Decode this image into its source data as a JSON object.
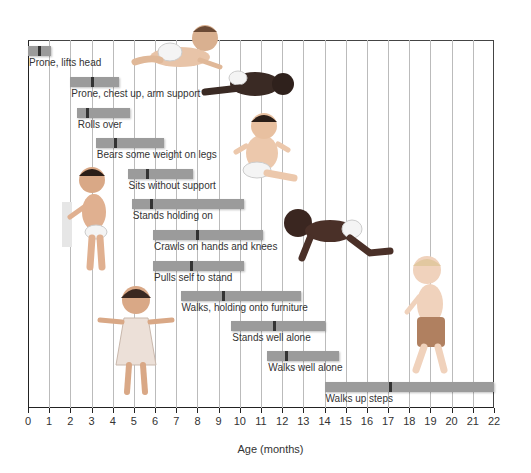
{
  "chart_data": {
    "type": "bar",
    "subtype": "range-bar (Gantt) with median markers",
    "title": "",
    "xlabel": "Age (months)",
    "ylabel": "",
    "xlim": [
      0,
      22
    ],
    "xticks": [
      0,
      1,
      2,
      3,
      4,
      5,
      6,
      7,
      8,
      9,
      10,
      11,
      12,
      13,
      14,
      15,
      16,
      17,
      18,
      19,
      20,
      21,
      22
    ],
    "grid": "vertical lines at each month",
    "legend": null,
    "bar_color": "#9b9b9b",
    "marker_color": "#333333",
    "milestones": [
      {
        "label": "Prone, lifts head",
        "start": 0.0,
        "end": 1.1,
        "marker": 0.5
      },
      {
        "label": "Prone, chest up, arm support",
        "start": 2.0,
        "end": 4.3,
        "marker": 3.0
      },
      {
        "label": "Rolls over",
        "start": 2.3,
        "end": 4.8,
        "marker": 2.8
      },
      {
        "label": "Bears some weight on legs",
        "start": 3.2,
        "end": 6.4,
        "marker": 4.1
      },
      {
        "label": "Sits without support",
        "start": 4.7,
        "end": 7.8,
        "marker": 5.6
      },
      {
        "label": "Stands holding on",
        "start": 4.9,
        "end": 10.2,
        "marker": 5.8
      },
      {
        "label": "Crawls on hands and knees",
        "start": 5.9,
        "end": 11.1,
        "marker": 8.0
      },
      {
        "label": "Pulls self to stand",
        "start": 5.9,
        "end": 10.2,
        "marker": 7.7
      },
      {
        "label": "Walks, holding onto furniture",
        "start": 7.2,
        "end": 12.9,
        "marker": 9.2
      },
      {
        "label": "Stands well alone",
        "start": 9.6,
        "end": 14.0,
        "marker": 11.6
      },
      {
        "label": "Walks well alone",
        "start": 11.3,
        "end": 14.7,
        "marker": 12.2
      },
      {
        "label": "Walks up steps",
        "start": 14.0,
        "end": 22.0,
        "marker": 17.1
      }
    ],
    "illustrations": [
      "infant prone lifting head",
      "infant prone chest up",
      "infant sitting without support",
      "infant standing holding on",
      "infant crawling",
      "toddler standing well alone",
      "toddler walking"
    ]
  }
}
